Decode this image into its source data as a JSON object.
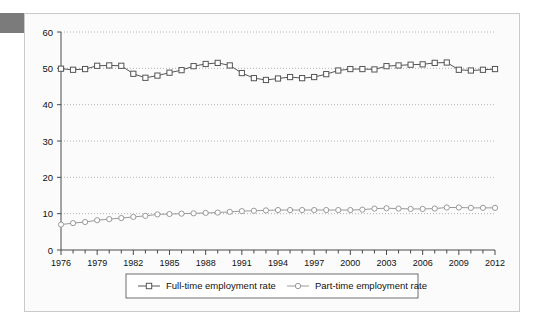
{
  "figure": {
    "background_color": "#fbfbfb",
    "frame_color": "#c9c9c9",
    "corner_tab_color": "#7b7b7b"
  },
  "chart_data": {
    "type": "line",
    "title": "",
    "subtitle": "",
    "xlabel": "",
    "ylabel": "",
    "xlim": [
      1976,
      2012
    ],
    "ylim": [
      0,
      60
    ],
    "y_ticks": [
      0,
      10,
      20,
      30,
      40,
      50,
      60
    ],
    "x_ticks_major": [
      1976,
      1979,
      1982,
      1985,
      1988,
      1991,
      1994,
      1997,
      2000,
      2003,
      2006,
      2009,
      2012
    ],
    "x_ticks_minor_every": 1,
    "grid": "horizontal-dotted",
    "legend_position": "bottom-center",
    "x": [
      1976,
      1977,
      1978,
      1979,
      1980,
      1981,
      1982,
      1983,
      1984,
      1985,
      1986,
      1987,
      1988,
      1989,
      1990,
      1991,
      1992,
      1993,
      1994,
      1995,
      1996,
      1997,
      1998,
      1999,
      2000,
      2001,
      2002,
      2003,
      2004,
      2005,
      2006,
      2007,
      2008,
      2009,
      2010,
      2011,
      2012
    ],
    "series": [
      {
        "name": "Full-time employment rate",
        "marker": "square",
        "color": "#555555",
        "marker_fill": "#ffffff",
        "values": [
          49.9,
          49.6,
          49.8,
          50.7,
          50.8,
          50.7,
          48.5,
          47.4,
          48.0,
          48.8,
          49.5,
          50.6,
          51.2,
          51.5,
          50.8,
          48.7,
          47.3,
          46.8,
          47.2,
          47.6,
          47.3,
          47.6,
          48.4,
          49.4,
          49.8,
          49.8,
          49.7,
          50.6,
          50.8,
          51.0,
          51.1,
          51.5,
          51.6,
          49.6,
          49.4,
          49.6,
          49.8
        ]
      },
      {
        "name": "Part-time employment rate",
        "marker": "circle",
        "color": "#9a9a9a",
        "marker_fill": "#ffffff",
        "values": [
          7.0,
          7.4,
          7.7,
          8.2,
          8.5,
          8.8,
          9.1,
          9.4,
          9.8,
          9.9,
          10.0,
          10.1,
          10.2,
          10.3,
          10.5,
          10.7,
          10.8,
          10.9,
          11.0,
          11.0,
          11.0,
          11.0,
          11.0,
          11.0,
          11.0,
          11.1,
          11.4,
          11.5,
          11.4,
          11.3,
          11.3,
          11.4,
          11.7,
          11.7,
          11.6,
          11.6,
          11.6
        ]
      }
    ]
  },
  "legend": {
    "entries": [
      {
        "label": "Full-time employment rate",
        "marker": "square"
      },
      {
        "label": "Part-time employment rate",
        "marker": "circle"
      }
    ]
  },
  "y_tick_labels": [
    "0",
    "10",
    "20",
    "30",
    "40",
    "50",
    "60"
  ],
  "x_tick_labels": [
    "1976",
    "1979",
    "1982",
    "1985",
    "1988",
    "1991",
    "1994",
    "1997",
    "2000",
    "2003",
    "2006",
    "2009",
    "2012"
  ]
}
